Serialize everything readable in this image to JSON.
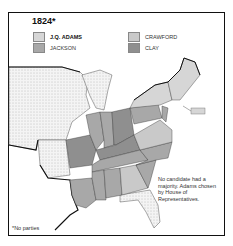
{
  "title": "1824*",
  "legend": [
    {
      "label": "J.Q. ADAMS",
      "color": "#d6d6d6",
      "bold": true
    },
    {
      "label": "JACKSON",
      "color": "#a8a8a8",
      "bold": false
    },
    {
      "label": "CRAWFORD",
      "color": "#c9c9c9",
      "bold": false
    },
    {
      "label": "CLAY",
      "color": "#8f8f8f",
      "bold": false
    }
  ],
  "note": "No candidate had a majority. Adams chosen by House of Representatives.",
  "footnote": "*No parties",
  "colors": {
    "adams": "#d6d6d6",
    "jackson": "#a8a8a8",
    "crawford": "#c9c9c9",
    "clay": "#8f8f8f",
    "territory": "#efefef",
    "border": "#111111"
  }
}
